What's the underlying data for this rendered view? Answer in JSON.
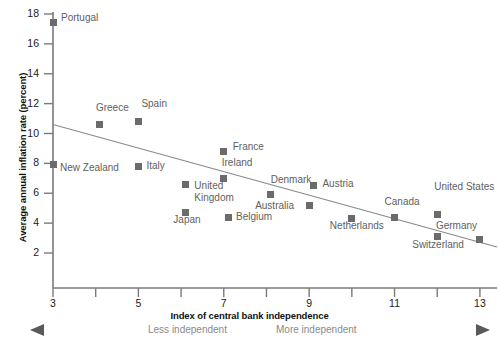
{
  "chart_data": {
    "type": "scatter",
    "title": "",
    "xlabel": "Index of central bank independence",
    "ylabel": "Average annual inflation rate (percent)",
    "xlim": [
      3,
      13.4
    ],
    "ylim": [
      0,
      18
    ],
    "xticks": [
      "3",
      "4",
      "5",
      "6",
      "7",
      "8",
      "9",
      "10",
      "11",
      "12",
      "13"
    ],
    "xtick_labeled": [
      "3",
      "5",
      "7",
      "9",
      "11",
      "13"
    ],
    "yticks": [
      "2",
      "4",
      "6",
      "8",
      "10",
      "12",
      "14",
      "16",
      "18"
    ],
    "grid": false,
    "legend": null,
    "marker_color": "#6b6b6b",
    "trendline_color": "#8a8a8a",
    "trendline": {
      "x1": 3.0,
      "y1": 10.6,
      "x2": 13.4,
      "y2": 2.4
    },
    "points": [
      {
        "name": "Portugal",
        "x": 3.0,
        "y": 17.4,
        "label_dx": 8,
        "label_dy": -5
      },
      {
        "name": "Greece",
        "x": 4.1,
        "y": 10.6,
        "label_dx": -4,
        "label_dy": -17
      },
      {
        "name": "Spain",
        "x": 5.0,
        "y": 10.8,
        "label_dx": 3,
        "label_dy": -18
      },
      {
        "name": "New Zealand",
        "x": 3.0,
        "y": 7.9,
        "label_dx": 7,
        "label_dy": 3
      },
      {
        "name": "Italy",
        "x": 5.0,
        "y": 7.8,
        "label_dx": 8,
        "label_dy": 0
      },
      {
        "name": "United Kingdom",
        "x": 6.1,
        "y": 6.6,
        "label_dx": 9,
        "label_dy": 2
      },
      {
        "name": "France",
        "x": 7.0,
        "y": 8.8,
        "label_dx": 9,
        "label_dy": -4
      },
      {
        "name": "Ireland",
        "x": 7.0,
        "y": 7.0,
        "label_dx": -2,
        "label_dy": -15
      },
      {
        "name": "Japan",
        "x": 6.1,
        "y": 4.7,
        "label_dx": -12,
        "label_dy": 7
      },
      {
        "name": "Belgium",
        "x": 7.1,
        "y": 4.4,
        "label_dx": 8,
        "label_dy": 0
      },
      {
        "name": "Denmark",
        "x": 8.1,
        "y": 5.9,
        "label_dx": 0,
        "label_dy": -15
      },
      {
        "name": "Austria",
        "x": 9.1,
        "y": 6.5,
        "label_dx": 9,
        "label_dy": -2
      },
      {
        "name": "Australia",
        "x": 9.0,
        "y": 5.2,
        "label_dx": -54,
        "label_dy": 1
      },
      {
        "name": "Netherlands",
        "x": 10.0,
        "y": 4.3,
        "label_dx": -22,
        "label_dy": 7
      },
      {
        "name": "Canada",
        "x": 11.0,
        "y": 4.4,
        "label_dx": -10,
        "label_dy": -15
      },
      {
        "name": "United States",
        "x": 12.0,
        "y": 4.6,
        "label_dx": -3,
        "label_dy": -27
      },
      {
        "name": "Switzerland",
        "x": 12.0,
        "y": 3.1,
        "label_dx": -25,
        "label_dy": 8
      },
      {
        "name": "Germany",
        "x": 13.0,
        "y": 2.9,
        "label_dx": -44,
        "label_dy": -14
      }
    ],
    "annotations": {
      "left_arrow_text": "Less independent",
      "right_arrow_text": "More independent"
    }
  }
}
